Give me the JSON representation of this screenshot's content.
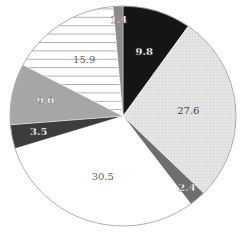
{
  "chart_data": {
    "type": "pie",
    "title": "",
    "start_angle_deg": 90,
    "direction": "clockwise",
    "slices": [
      {
        "label": "9.8",
        "value": 9.8,
        "fill": "#151515",
        "pattern": "solid",
        "text_color": "#ffffff"
      },
      {
        "label": "27.6",
        "value": 27.6,
        "fill": "#e2e2e2",
        "pattern": "dotted",
        "text_color": "#444444"
      },
      {
        "label": "2.4",
        "value": 2.4,
        "fill": "#6e6e6e",
        "pattern": "solid",
        "text_color": "#ffffff"
      },
      {
        "label": "30.5",
        "value": 30.5,
        "fill": "#ffffff",
        "pattern": "solid",
        "text_color": "#666666"
      },
      {
        "label": "3.5",
        "value": 3.5,
        "fill": "#3c3c3c",
        "pattern": "solid",
        "text_color": "#ffffff"
      },
      {
        "label": "9.0",
        "value": 9.0,
        "fill": "#a6a6a6",
        "pattern": "solid",
        "text_color": "#ffffff"
      },
      {
        "label": "15.9",
        "value": 15.9,
        "fill": "#ffffff",
        "pattern": "horizontal-lines",
        "text_color": "#666666"
      },
      {
        "label": "1.4",
        "value": 1.4,
        "fill": "#8c8c8c",
        "pattern": "solid",
        "text_color": "#ffffff"
      }
    ],
    "legend": null
  }
}
